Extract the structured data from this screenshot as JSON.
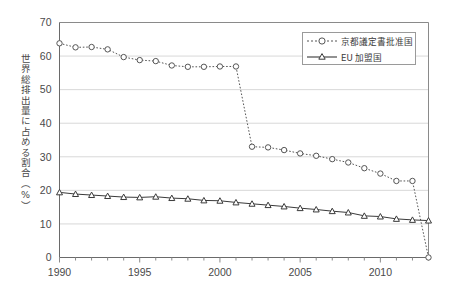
{
  "chart_data": {
    "type": "line",
    "title": "",
    "xlabel": "",
    "ylabel": "世界総排出量に占める割合（%）",
    "xlim": [
      1990,
      2013
    ],
    "ylim": [
      0,
      70
    ],
    "ytick_labels": [
      "0",
      "10",
      "20",
      "30",
      "40",
      "50",
      "60",
      "70"
    ],
    "ytick_values": [
      0,
      10,
      20,
      30,
      40,
      50,
      60,
      70
    ],
    "xtick_labels": [
      "1990",
      "1995",
      "2000",
      "2005",
      "2010"
    ],
    "xtick_values": [
      1990,
      1995,
      2000,
      2005,
      2010
    ],
    "x": [
      1990,
      1991,
      1992,
      1993,
      1994,
      1995,
      1996,
      1997,
      1998,
      1999,
      2000,
      2001,
      2002,
      2003,
      2004,
      2005,
      2006,
      2007,
      2008,
      2009,
      2010,
      2011,
      2012,
      2013
    ],
    "grid": "horizontal",
    "legend_position": "top-right",
    "series": [
      {
        "name": "京都議定書批准国",
        "marker": "circle-open",
        "linestyle": "dotted",
        "color": "#555555",
        "values": [
          63.8,
          62.6,
          62.7,
          62.0,
          59.7,
          58.8,
          58.5,
          57.2,
          56.8,
          56.8,
          56.9,
          56.9,
          33.0,
          32.8,
          32.0,
          31.0,
          30.3,
          29.3,
          28.3,
          26.6,
          25.0,
          22.8,
          22.8,
          0.0
        ]
      },
      {
        "name": "EU 加盟国",
        "marker": "triangle-open",
        "linestyle": "solid",
        "color": "#3a3a3a",
        "values": [
          19.4,
          18.9,
          18.6,
          18.3,
          18.0,
          17.9,
          18.1,
          17.7,
          17.5,
          17.0,
          16.9,
          16.4,
          16.0,
          15.6,
          15.2,
          14.7,
          14.3,
          13.8,
          13.4,
          12.4,
          12.2,
          11.5,
          11.2,
          11.0
        ]
      }
    ]
  },
  "legend": {
    "items": [
      {
        "label": "京都議定書批准国"
      },
      {
        "label": "EU 加盟国"
      }
    ]
  }
}
